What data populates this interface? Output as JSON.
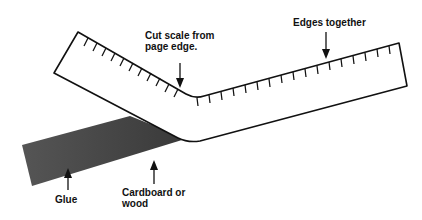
{
  "diagram": {
    "type": "scale-mounting-illustration",
    "labels": {
      "cut_scale_line1": "Cut scale from",
      "cut_scale_line2": "page edge.",
      "edges_together": "Edges together",
      "glue": "Glue",
      "cardboard_line1": "Cardboard or",
      "cardboard_line2": "wood"
    },
    "colors": {
      "stroke": "#111111",
      "paper": "#ffffff",
      "glue": "#4a4a4a"
    }
  }
}
